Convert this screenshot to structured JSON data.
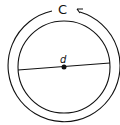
{
  "diagram": {
    "labels": {
      "circumference": "C",
      "diameter": "d"
    },
    "colors": {
      "stroke": "#111111",
      "background": "#ffffff"
    }
  }
}
